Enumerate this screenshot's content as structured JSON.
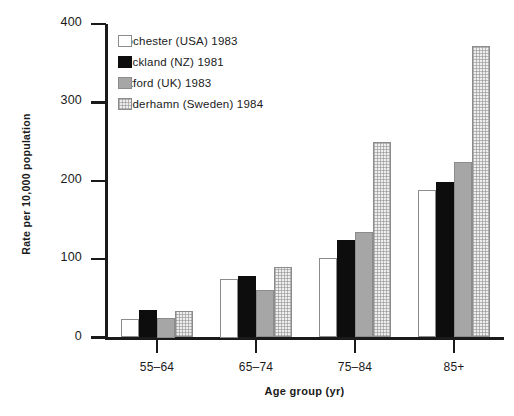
{
  "chart_data": {
    "type": "bar",
    "title": "",
    "subtitle": "",
    "xlabel": "Age group (yr)",
    "ylabel": "Rate per 10,000 population",
    "categories": [
      "55–64",
      "65–74",
      "75–84",
      "85+"
    ],
    "ylim": [
      0,
      400
    ],
    "yticks": [
      0,
      100,
      200,
      300,
      400
    ],
    "ytick_labels": [
      "0",
      "100",
      "200",
      "300",
      "400"
    ],
    "grid": false,
    "legend_position": "upper-left-inside",
    "series": [
      {
        "name": "Rochester (USA) 1983",
        "swatch": "white-outline",
        "color": "#ffffff",
        "values": [
          23,
          75,
          101,
          188
        ]
      },
      {
        "name": "Auckland (NZ) 1981",
        "swatch": "solid-black",
        "color": "#0d0d0d",
        "values": [
          35,
          78,
          124,
          198
        ]
      },
      {
        "name": "Oxford (UK) 1983",
        "swatch": "solid-gray",
        "color": "#a6a6a6",
        "values": [
          25,
          60,
          135,
          224
        ]
      },
      {
        "name": "Söderhamn (Sweden) 1984",
        "swatch": "light-stipple",
        "color": "#eeeeee",
        "values": [
          34,
          90,
          249,
          372
        ]
      }
    ]
  }
}
